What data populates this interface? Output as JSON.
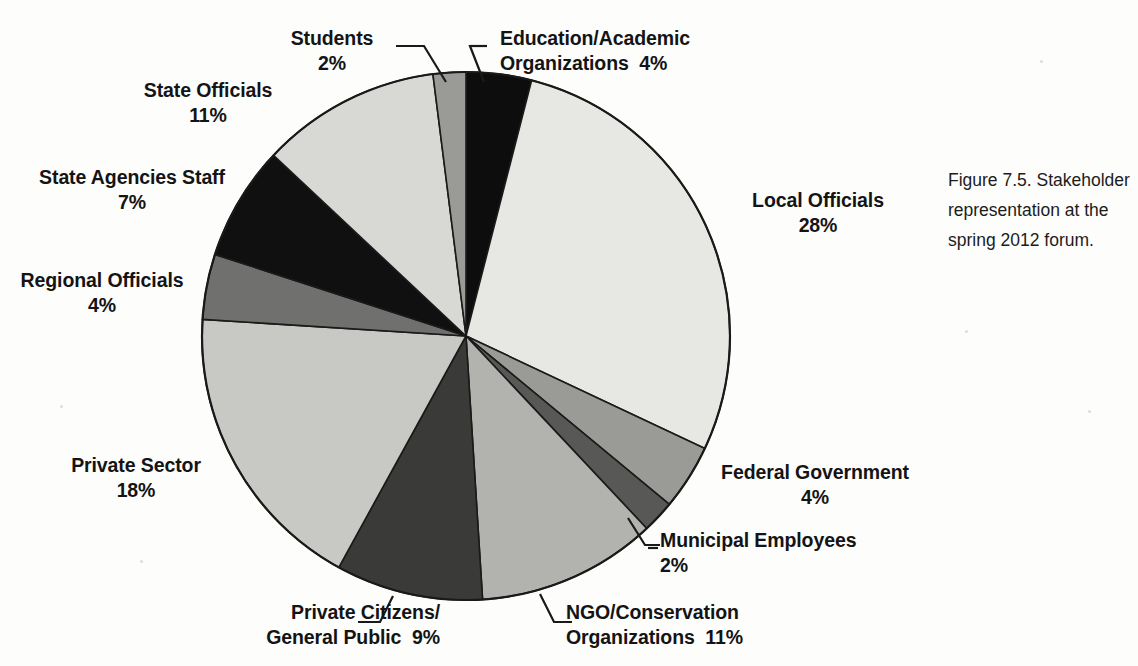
{
  "caption": {
    "text": "Figure 7.5. Stakeholder representation at the spring 2012 forum."
  },
  "labels": {
    "students": "Students\n2%",
    "education": "Education/Academic\nOrganizations  4%",
    "state_officials": "State Officials\n11%",
    "state_agencies": "State Agencies Staff\n7%",
    "regional_officials": "Regional Officials\n4%",
    "private_sector": "Private Sector\n18%",
    "private_citizens": "Private Citizens/\nGeneral Public  9%",
    "ngo": "NGO/Conservation\nOrganizations  11%",
    "municipal": "Municipal Employees\n2%",
    "federal": "Federal Government\n4%",
    "local_officials": "Local Officials\n28%"
  },
  "chart_data": {
    "type": "pie",
    "title": "Stakeholder representation at the spring 2012 forum",
    "unit": "percent",
    "start_angle_deg": 0,
    "direction": "clockwise",
    "legend": "none-labels-outside",
    "center": {
      "cx": 466,
      "cy": 336,
      "r": 264
    },
    "categories": [
      "Education/Academic Organizations",
      "Local Officials",
      "Federal Government",
      "Municipal Employees",
      "NGO/Conservation Organizations",
      "Private Citizens/General Public",
      "Private Sector",
      "Regional Officials",
      "State Agencies Staff",
      "State Officials",
      "Students"
    ],
    "values": [
      4,
      28,
      4,
      2,
      11,
      9,
      18,
      4,
      7,
      11,
      2
    ],
    "colors": [
      "#0d0d0d",
      "#e7e7e4",
      "#9a9a97",
      "#585856",
      "#b2b2af",
      "#3a3a38",
      "#c8c8c5",
      "#70706e",
      "#101010",
      "#d8d8d5",
      "#9a9a97"
    ],
    "slices": [
      {
        "label": "Education/Academic Organizations",
        "value": 4,
        "color": "#0d0d0d"
      },
      {
        "label": "Local Officials",
        "value": 28,
        "color": "#e7e7e4"
      },
      {
        "label": "Federal Government",
        "value": 4,
        "color": "#9a9a97"
      },
      {
        "label": "Municipal Employees",
        "value": 2,
        "color": "#585856"
      },
      {
        "label": "NGO/Conservation Organizations",
        "value": 11,
        "color": "#b2b2af"
      },
      {
        "label": "Private Citizens/General Public",
        "value": 9,
        "color": "#3a3a38"
      },
      {
        "label": "Private Sector",
        "value": 18,
        "color": "#c8c8c5"
      },
      {
        "label": "Regional Officials",
        "value": 4,
        "color": "#70706e"
      },
      {
        "label": "State Agencies Staff",
        "value": 7,
        "color": "#101010"
      },
      {
        "label": "State Officials",
        "value": 11,
        "color": "#d8d8d5"
      },
      {
        "label": "Students",
        "value": 2,
        "color": "#9a9a97"
      }
    ]
  }
}
